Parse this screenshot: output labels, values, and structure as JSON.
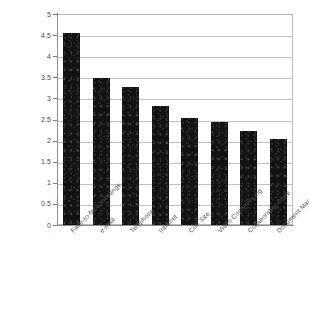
{
  "chart_data": {
    "type": "bar",
    "title": "",
    "subtitle": "",
    "xlabel": "",
    "ylabel": "",
    "ylim": [
      0,
      5
    ],
    "grid": true,
    "legend": false,
    "orientation": "vertical",
    "bar_color": "#121212",
    "categories": [
      "Face-to-face meetings",
      "e-mail",
      "Telephone",
      "Intranet",
      "CoP Site",
      "Video Conferencing",
      "Collaboration tools",
      "Document Management System"
    ],
    "values": [
      4.55,
      3.48,
      3.27,
      2.82,
      2.53,
      2.45,
      2.22,
      2.05
    ],
    "ytick_labels": [
      "0",
      "0.5",
      "1",
      "1.5",
      "2",
      "2.5",
      "3",
      "3.5",
      "4",
      "4.5",
      "5"
    ],
    "ytick_values": [
      0,
      0.5,
      1,
      1.5,
      2,
      2.5,
      3,
      3.5,
      4,
      4.5,
      5
    ]
  },
  "colors": {
    "bar": "#121212",
    "gridline": "#c2c2c2",
    "axis": "#8e8e8e",
    "frame": "#b9b9b9",
    "text": "#4a4a4a",
    "background": "#ffffff"
  }
}
